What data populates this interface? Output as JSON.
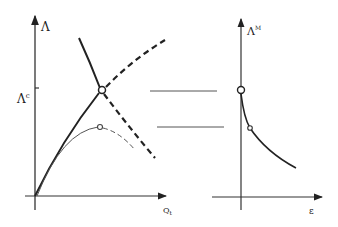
{
  "left_plot": {
    "y_axis_label": "Λ",
    "critical_label_base": "Λ",
    "critical_label_sup": "c",
    "x_axis_label_base": "Q",
    "x_axis_label_sub": "t"
  },
  "right_plot": {
    "y_axis_label_base": "Λ",
    "y_axis_label_sup": "M",
    "x_axis_label": "ε"
  },
  "colors": {
    "ink": "#222222",
    "thin_ink": "#555555",
    "background": "#ffffff"
  }
}
